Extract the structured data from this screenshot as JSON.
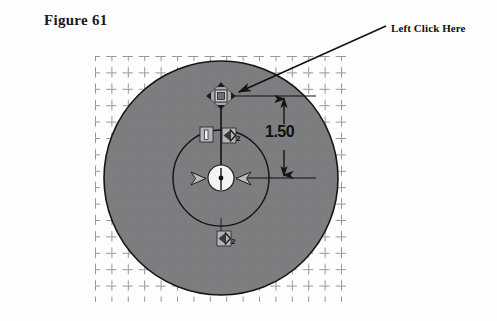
{
  "figure": {
    "title": "Figure 61"
  },
  "callout": {
    "label": "Left Click Here",
    "arrow_from_x": 386,
    "arrow_from_y": 26,
    "arrow_to_x": 233,
    "arrow_to_y": 95
  },
  "sketch": {
    "outer_circle": {
      "cx": 221,
      "cy": 178,
      "r": 117,
      "fill": "#7d7d80",
      "stroke": "#161616"
    },
    "inner_circle": {
      "cx": 221,
      "cy": 178,
      "r": 48,
      "fill": "none",
      "stroke": "#161616"
    },
    "center_point": {
      "cx": 221,
      "cy": 178
    },
    "top_handle": {
      "cx": 221,
      "cy": 96,
      "label": "move-handle"
    },
    "grid": {
      "x": 95,
      "y": 56,
      "width": 255,
      "height": 246,
      "spacing": 16.4,
      "style": "dashed"
    }
  },
  "dimension": {
    "value": "1.50",
    "line_x": 284,
    "top_y": 96,
    "bottom_y": 178,
    "extension_top_y": 96,
    "extension_bottom_y": 178
  },
  "relations": [
    {
      "name": "vertical-relation",
      "symbol": "|",
      "x": 205,
      "y": 131,
      "sub": ""
    },
    {
      "name": "concentric-relation-upper",
      "symbol": "R",
      "x": 227,
      "y": 131,
      "sub": "2"
    },
    {
      "name": "concentric-relation-lower",
      "symbol": "R",
      "x": 222,
      "y": 236,
      "sub": "2"
    }
  ],
  "colors": {
    "disk_gray": "#7d7d80",
    "line_black": "#141414",
    "grid_gray": "#7a7a86",
    "page_white": "#fdfdfd",
    "badge_light": "#d6d6d6"
  }
}
